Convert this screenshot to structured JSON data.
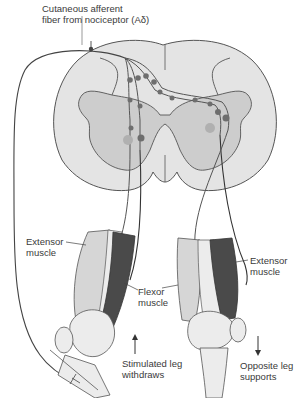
{
  "diagram": {
    "type": "anatomical-reflex-diagram",
    "labels": {
      "afferent_line1": "Cutaneous afferent",
      "afferent_line2": "fiber from nociceptor (Aδ)",
      "left_extensor_line1": "Extensor",
      "left_extensor_line2": "muscle",
      "flexor_line1": "Flexor",
      "flexor_line2": "muscle",
      "right_extensor_line1": "Extensor",
      "right_extensor_line2": "muscle",
      "stimulated_line1": "Stimulated leg",
      "stimulated_line2": "withdraws",
      "opposite_line1": "Opposite leg",
      "opposite_line2": "supports"
    },
    "arrows": {
      "stimulated": "up",
      "opposite": "down"
    },
    "colors": {
      "white_matter": "#e4e4e4",
      "gray_matter": "#cdcdcd",
      "outline": "#555555",
      "neuron": "#6e6e6e",
      "neuron_pale": "#b0b0b0",
      "flexor_dark": "#4a4a4a",
      "muscle_light": "#d6d6d6",
      "bone": "#ececec"
    }
  }
}
